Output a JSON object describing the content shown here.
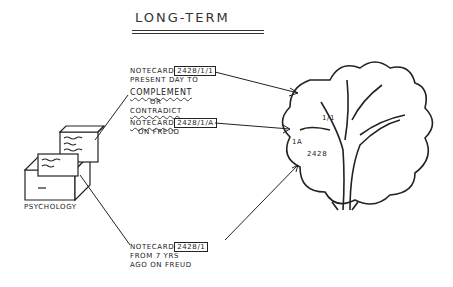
{
  "title": "LONG-TERM",
  "archive": {
    "label": "PSYCHOLOGY"
  },
  "notes": [
    {
      "prefix": "NOTECARD",
      "id": "2428/1/1",
      "lines": [
        "PRESENT DAY TO"
      ],
      "emphasis": "COMPLEMENT",
      "connector": "OR",
      "alt": "CONTRADICT"
    },
    {
      "prefix": "NOTECARD",
      "id": "2428/1/A",
      "lines": [
        "ON FREUD"
      ]
    },
    {
      "prefix": "NOTECARD",
      "id": "2428/1",
      "lines": [
        "FROM 7 YRS",
        "AGO ON FREUD"
      ]
    }
  ],
  "tree": {
    "labels": {
      "trunk": "2428",
      "branch_a": "1A",
      "branch_1": "1/1"
    }
  }
}
